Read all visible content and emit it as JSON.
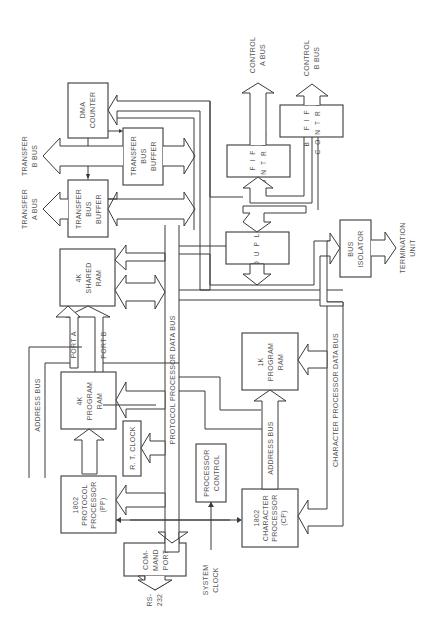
{
  "diagram": {
    "orientation": "rotated 90 degrees counter-clockwise",
    "blocks": {
      "dma_counter": [
        "DMA",
        "COUNTER"
      ],
      "transfer_bus_buffer_b": [
        "TRANSFER",
        "BUS",
        "BUFFER"
      ],
      "transfer_bus_buffer_a": [
        "TRANSFER",
        "BUS",
        "BUFFER"
      ],
      "shared_ram": [
        "4K",
        "SHARED",
        "RAM"
      ],
      "program_ram_4k": [
        "4K",
        "PROGRAM",
        "RAM"
      ],
      "rt_clock": "R. T. CLOCK",
      "protocol_processor": [
        "1802",
        "PROTOCOL",
        "PROCESSOR",
        "(PP)"
      ],
      "command_port": [
        "COM-",
        "MAND",
        "PORT"
      ],
      "processor_control": [
        "PROCESSOR",
        "CONTROL"
      ],
      "character_processor": [
        "1802",
        "CHARACTER",
        "PROCESSOR",
        "(CP)"
      ],
      "program_ram_1k": [
        "1K",
        "PROGRAM",
        "RAM"
      ],
      "coupler": "COUPLER",
      "a_fifo_control": [
        "A  FIFO",
        "CONTROL"
      ],
      "b_fifo_control": [
        "B  FIFO",
        "CONTROL"
      ],
      "bus_isolator": [
        "BUS",
        "ISOLATOR"
      ]
    },
    "labels": {
      "transfer_b_bus": [
        "TRANSFER",
        "B BUS"
      ],
      "transfer_a_bus": [
        "TRANSFER",
        "A BUS"
      ],
      "control_a_bus": [
        "CONTROL",
        "A BUS"
      ],
      "control_b_bus": [
        "CONTROL",
        "B BUS"
      ],
      "termination_unit": [
        "TERMINATION",
        "UNIT"
      ],
      "port_a": "PORT A",
      "port_b": "PORT B",
      "address_bus_pp": "ADDRESS BUS",
      "protocol_processor_data_bus": "PROTOCOL PROCESSOR DATA BUS",
      "address_bus_cp": "ADDRESS BUS",
      "character_processor_data_bus": "CHARACTER PROCESSOR DATA BUS",
      "system_clock": [
        "SYSTEM",
        "CLOCK"
      ],
      "rs232": [
        "RS-",
        "232"
      ]
    }
  }
}
